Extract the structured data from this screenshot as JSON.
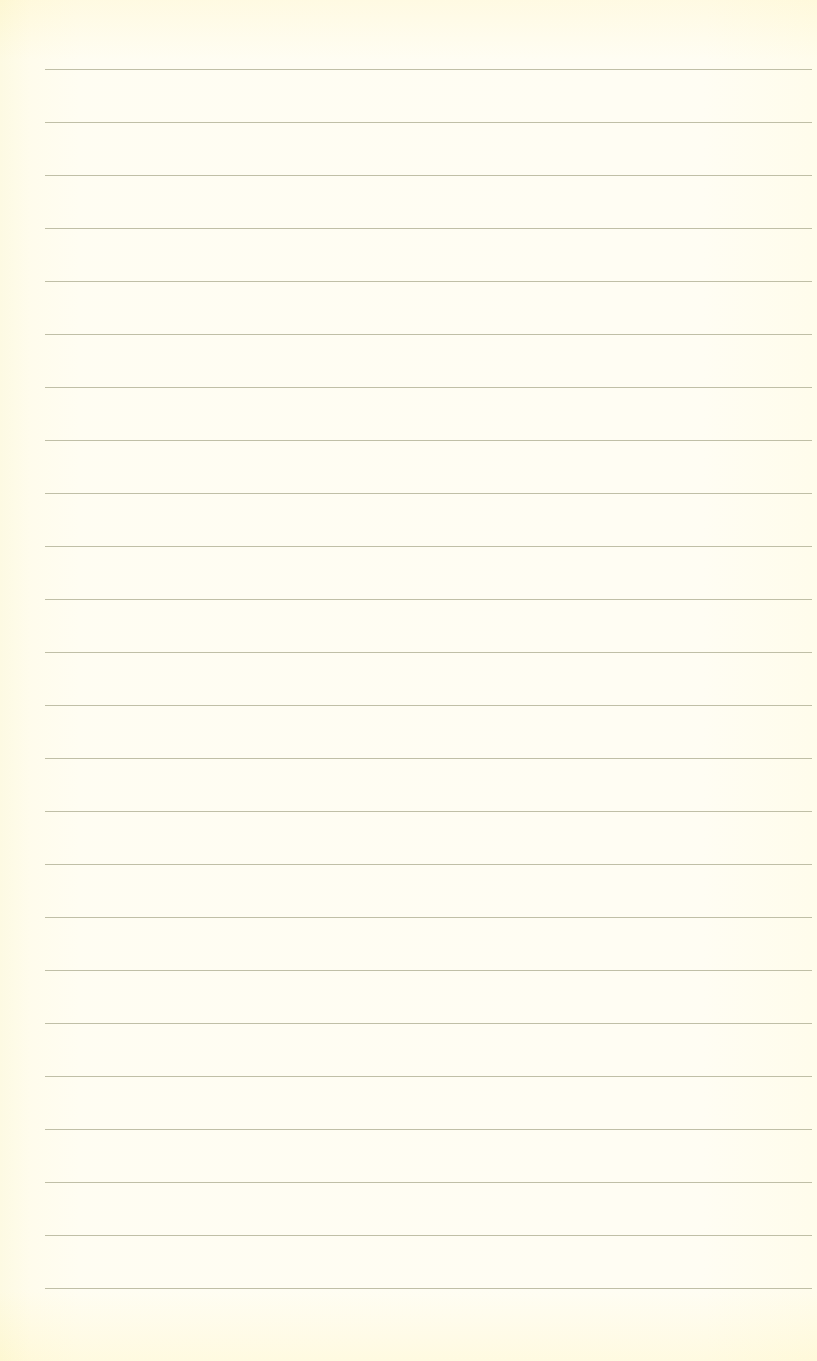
{
  "page": {
    "type": "ruled-paper",
    "background_color": "#fffef8",
    "line_color": "#b9b89f",
    "line_count": 24,
    "first_line_y": 69,
    "line_spacing": 53,
    "line_left": 45,
    "line_right": 812
  }
}
